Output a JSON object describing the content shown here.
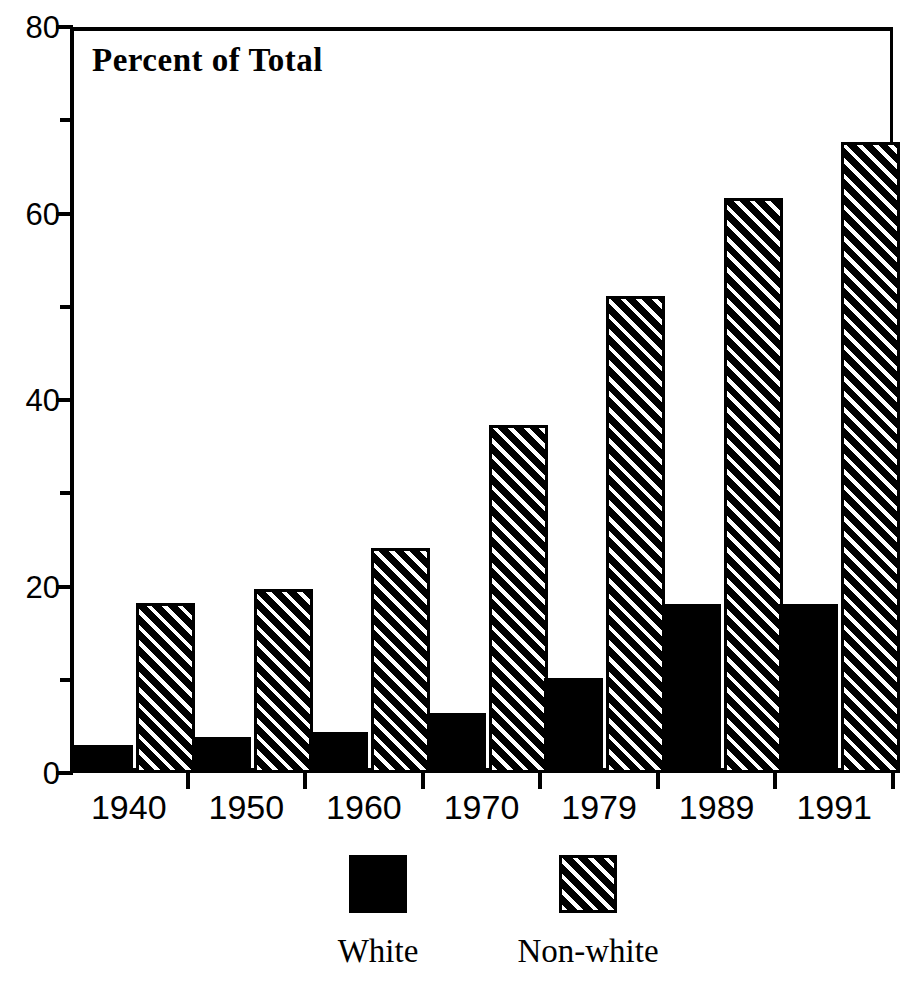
{
  "chart_data": {
    "type": "bar",
    "title": "Percent of Total",
    "xlabel": "",
    "ylabel": "Percent of Total",
    "categories": [
      "1940",
      "1950",
      "1960",
      "1970",
      "1979",
      "1989",
      "1991"
    ],
    "series": [
      {
        "name": "White",
        "fill": "solid-black",
        "values": [
          3.0,
          3.9,
          4.4,
          6.4,
          10.2,
          18.1,
          18.1
        ]
      },
      {
        "name": "Non-white",
        "fill": "diagonal-hatch",
        "values": [
          18.2,
          19.7,
          24.1,
          37.3,
          51.2,
          61.7,
          67.7
        ]
      }
    ],
    "ylim": [
      0,
      80
    ],
    "yticks_major": [
      0,
      20,
      40,
      60,
      80
    ],
    "yticks_minor": [
      10,
      30,
      50,
      70
    ],
    "ytick_labels": [
      "0",
      "20",
      "40",
      "60",
      "80"
    ],
    "grid": false,
    "legend_position": "bottom",
    "colors": {
      "series_white": "#000000",
      "series_nonwhite_background": "#000000",
      "series_nonwhite_hatch": "#ffffff",
      "axis": "#000000",
      "plot_background": "#ffffff"
    }
  },
  "axis": {
    "y_labels": [
      {
        "value": 80,
        "text": "80"
      },
      {
        "value": 60,
        "text": "60"
      },
      {
        "value": 40,
        "text": "40"
      },
      {
        "value": 20,
        "text": "20"
      },
      {
        "value": 0,
        "text": "0"
      }
    ],
    "x_labels": [
      "1940",
      "1950",
      "1960",
      "1970",
      "1979",
      "1989",
      "1991"
    ]
  },
  "legend": {
    "items": [
      {
        "label": "White",
        "fill": "solid"
      },
      {
        "label": "Non-white",
        "fill": "hatch"
      }
    ]
  }
}
